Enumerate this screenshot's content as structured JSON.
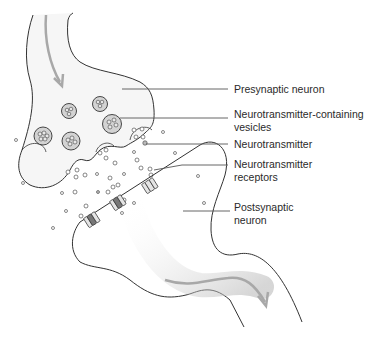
{
  "diagram": {
    "labels": [
      {
        "id": "presynaptic",
        "text": "Presynaptic neuron"
      },
      {
        "id": "vesicles",
        "text": "Neurotransmitter-containing\nvesicles"
      },
      {
        "id": "neurotransmitter",
        "text": "Neurotransmitter"
      },
      {
        "id": "receptors",
        "text": "Neurotransmitter\nreceptors"
      },
      {
        "id": "postsynaptic",
        "text": "Postsynaptic\nneuron"
      }
    ],
    "colors": {
      "outline": "#333333",
      "fill": "#f4f4f4",
      "vesicle_fill": "#d0d0d0",
      "arrow": "#a8a8a8",
      "leader": "#555555"
    }
  }
}
